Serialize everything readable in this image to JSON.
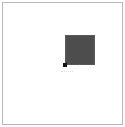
{
  "canvas": {
    "width": 125,
    "height": 127,
    "background": "#ffffff",
    "border_color": "#b8b8b8"
  },
  "shape": {
    "type": "square",
    "fill": "#4d4d4d",
    "x": 62,
    "y": 32,
    "size": 30
  },
  "handle": {
    "position": "bottom-left",
    "color": "#111111",
    "size": 4
  }
}
